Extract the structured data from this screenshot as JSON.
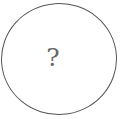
{
  "figure": {
    "shape": "circle",
    "label": "?",
    "stroke_color": "#555555",
    "text_color": "#666666"
  }
}
